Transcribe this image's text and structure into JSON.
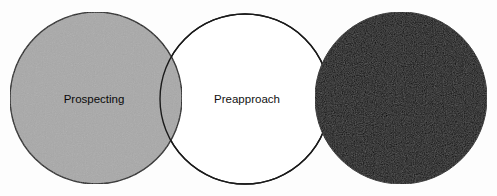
{
  "diagram": {
    "type": "venn-like sequence of three circles",
    "background": "#fdfdfd",
    "stroke_color": "#1a1a1a",
    "circles": [
      {
        "id": "prospecting",
        "label": "Prospecting",
        "cx": 96,
        "cy": 98,
        "r": 86,
        "fill": "#a9a9a9",
        "label_x": 94,
        "label_y": 99
      },
      {
        "id": "preapproach",
        "label": "Preapproach",
        "cx": 245,
        "cy": 99,
        "r": 85,
        "fill": "#ffffff",
        "label_x": 247,
        "label_y": 99
      },
      {
        "id": "third-stage",
        "label": "",
        "cx": 401,
        "cy": 98,
        "r": 86,
        "fill": "#050505",
        "label_x": 401,
        "label_y": 98
      }
    ]
  }
}
